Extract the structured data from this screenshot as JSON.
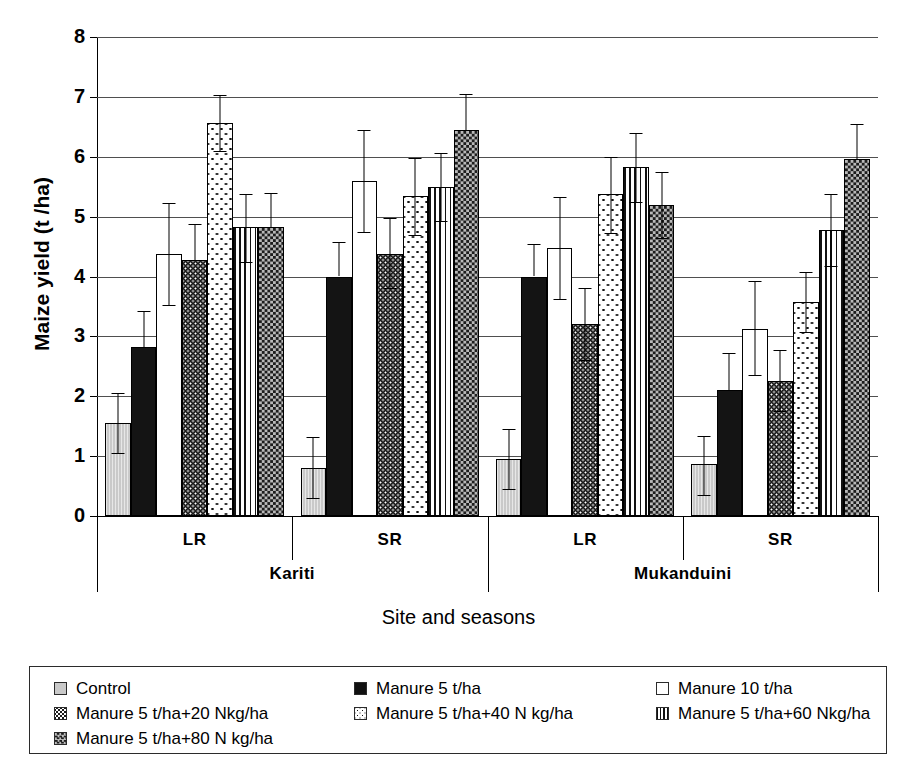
{
  "chart_data": {
    "type": "bar",
    "title": "",
    "xlabel": "Site and seasons",
    "ylabel": "Maize yield (t /ha)",
    "ylim": [
      0,
      8
    ],
    "ytick_labels": [
      "0",
      "1",
      "2",
      "3",
      "4",
      "5",
      "6",
      "7",
      "8"
    ],
    "grid": true,
    "legend_position": "below-plot",
    "errorbars": true,
    "sites": [
      "Kariti",
      "Mukanduini"
    ],
    "seasons": [
      "LR",
      "SR",
      "LR",
      "SR"
    ],
    "categories": [
      "Kariti LR",
      "Kariti SR",
      "Mukanduini LR",
      "Mukanduini SR"
    ],
    "series": [
      {
        "name": "Control",
        "pattern": "solid-grey",
        "values": [
          1.55,
          0.8,
          0.95,
          0.87
        ],
        "err_low": [
          1.05,
          0.3,
          0.45,
          0.35
        ],
        "err_high": [
          2.05,
          1.32,
          1.45,
          1.33
        ]
      },
      {
        "name": "Manure 5 t/ha",
        "pattern": "solid-black",
        "values": [
          2.82,
          4.0,
          4.0,
          2.1
        ],
        "err_low": [
          2.82,
          4.0,
          4.0,
          2.1
        ],
        "err_high": [
          3.42,
          4.58,
          4.55,
          2.72
        ]
      },
      {
        "name": "Manure 10 t/ha",
        "pattern": "white",
        "values": [
          4.37,
          5.6,
          4.47,
          3.13
        ],
        "err_low": [
          3.52,
          4.75,
          3.62,
          2.35
        ],
        "err_high": [
          5.22,
          6.45,
          5.32,
          3.92
        ]
      },
      {
        "name": "Manure 5 t/ha+20 Nkg/ha",
        "pattern": "dark-dots",
        "values": [
          4.28,
          4.38,
          3.2,
          2.25
        ],
        "err_low": [
          4.28,
          3.8,
          2.6,
          1.75
        ],
        "err_high": [
          4.88,
          4.98,
          3.8,
          2.78
        ]
      },
      {
        "name": "Manure 5 t/ha+40 N kg/ha",
        "pattern": "light-dots",
        "values": [
          6.57,
          5.35,
          5.37,
          3.58
        ],
        "err_low": [
          6.1,
          4.7,
          4.72,
          3.08
        ],
        "err_high": [
          7.03,
          5.98,
          6.0,
          4.08
        ]
      },
      {
        "name": "Manure 5 t/ha+60 Nkg/ha",
        "pattern": "vertical-stripes",
        "values": [
          4.82,
          5.5,
          5.83,
          4.78
        ],
        "err_low": [
          4.25,
          4.92,
          5.25,
          4.18
        ],
        "err_high": [
          5.37,
          6.07,
          6.4,
          5.37
        ]
      },
      {
        "name": "Manure 5 t/ha+80 N kg/ha",
        "pattern": "checkerboard",
        "values": [
          4.82,
          6.45,
          5.2,
          5.97
        ],
        "err_low": [
          4.82,
          6.45,
          4.65,
          5.97
        ],
        "err_high": [
          5.4,
          7.05,
          5.75,
          6.55
        ]
      }
    ]
  },
  "axis": {
    "y_title": "Maize yield (t /ha)",
    "x_title": "Site and seasons",
    "ticks": [
      "8",
      "7",
      "6",
      "5",
      "4",
      "3",
      "2",
      "1",
      "0"
    ]
  },
  "xaxis": {
    "season_labels": [
      "LR",
      "SR",
      "LR",
      "SR"
    ],
    "site_labels": [
      "Kariti",
      "Mukanduini"
    ]
  },
  "legend": {
    "rows": [
      [
        {
          "label": "Control",
          "swatch": "sw-control"
        },
        {
          "label": "Manure 5 t/ha",
          "swatch": "sw-black"
        },
        {
          "label": "Manure 10 t/ha",
          "swatch": "sw-white"
        }
      ],
      [
        {
          "label": "Manure 5 t/ha+20 Nkg/ha",
          "swatch": "sw-dot-dark"
        },
        {
          "label": "Manure 5 t/ha+40 N kg/ha",
          "swatch": "sw-dot-light"
        },
        {
          "label": "Manure 5 t/ha+60 Nkg/ha",
          "swatch": "sw-vstripe"
        }
      ],
      [
        {
          "label": "Manure 5 t/ha+80 N kg/ha",
          "swatch": "sw-check"
        }
      ]
    ]
  },
  "colors": {
    "axis": "#000000",
    "grid": "#4f4f4f",
    "control_fill": "#c9c9c9",
    "black_fill": "#141414",
    "check_fill": "#b9b9b9"
  }
}
